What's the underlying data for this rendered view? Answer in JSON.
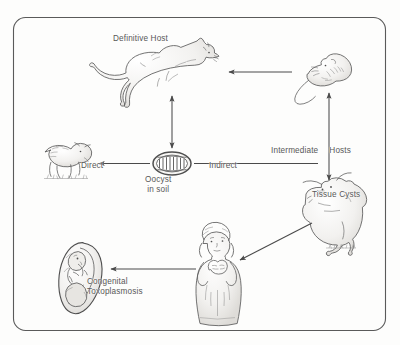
{
  "figure": {
    "style": "hand-drawn pencil sketch",
    "background_color": "#fdfdfc",
    "border_color": "#5a5a5a",
    "ink_color": "#555555",
    "label_color": "#585858"
  },
  "labels": {
    "definitive_host": "Definitive Host",
    "direct": "Direct",
    "indirect": "Indirect",
    "oocyst_in_soil": "Oocyst\nin soil",
    "intermediate_hosts_left": "Intermediate",
    "intermediate_hosts_right": "Hosts",
    "tissue_cysts": "Tissue Cysts",
    "congenital_toxoplasmosis": "Congenital\nToxoplasmosis"
  },
  "figures": [
    {
      "name": "cat",
      "role": "definitive-host",
      "facing": "right"
    },
    {
      "name": "rodent",
      "role": "intermediate-host",
      "facing": "left"
    },
    {
      "name": "sheep",
      "role": "grazing-animal",
      "facing": "right"
    },
    {
      "name": "oocyst",
      "role": "environmental-stage",
      "facing": "none"
    },
    {
      "name": "cow",
      "role": "intermediate-host",
      "facing": "left"
    },
    {
      "name": "pregnant-woman",
      "role": "human-host",
      "facing": "front"
    },
    {
      "name": "fetus",
      "role": "congenital-infection",
      "facing": "left"
    }
  ],
  "arrows": [
    {
      "name": "rodent-to-cat",
      "direction": "left",
      "heads": 1
    },
    {
      "name": "cat-to-oocyst",
      "direction": "vertical",
      "heads": 2
    },
    {
      "name": "oocyst-to-sheep",
      "direction": "left",
      "heads": 1
    },
    {
      "name": "oocyst-to-cow",
      "direction": "right",
      "heads": 0
    },
    {
      "name": "rodent-to-cow",
      "direction": "vertical",
      "heads": 2
    },
    {
      "name": "cow-to-woman",
      "direction": "diagonal-down-left",
      "heads": 1
    },
    {
      "name": "woman-to-fetus",
      "direction": "left",
      "heads": 1
    }
  ]
}
